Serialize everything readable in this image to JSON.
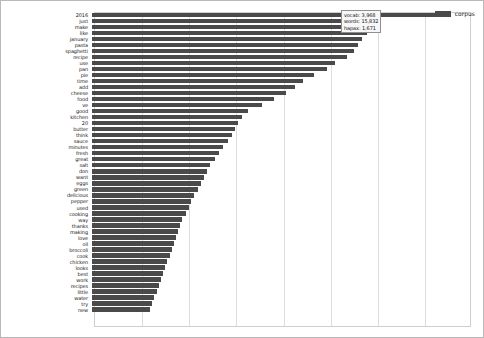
{
  "legend": {
    "items": [
      {
        "label": "corpus",
        "color": "#4a4a4a",
        "swatch_icon": "legend-swatch-icon"
      }
    ],
    "position": "top-right"
  },
  "tooltip": {
    "lines": [
      "vocab: 3,968",
      "words: 15,832",
      "hapax: 1,671"
    ],
    "vocab_label": "vocab: 3,968",
    "words_label": "words: 15,832",
    "hapax_label": "hapax: 1,671"
  },
  "axes": {
    "x_tick_labels": [],
    "y_tick_labels": [],
    "gridline_count": 7,
    "grid": true
  },
  "chart_data": {
    "type": "bar",
    "orientation": "horizontal",
    "title": "",
    "xlabel": "",
    "ylabel": "",
    "grid": true,
    "legend_position": "top-right",
    "series": [
      {
        "name": "corpus",
        "color": "#4a4a4a",
        "values": [
          327,
          262,
          259,
          255,
          251,
          247,
          243,
          237,
          226,
          218,
          206,
          196,
          188,
          180,
          169,
          158,
          145,
          139,
          136,
          133,
          130,
          126,
          122,
          118,
          114,
          110,
          107,
          104,
          101,
          98,
          95,
          92,
          90,
          87,
          84,
          82,
          80,
          78,
          76,
          74,
          72,
          70,
          68,
          66,
          64,
          62,
          60,
          58,
          56,
          54
        ]
      }
    ],
    "categories": [
      "2016",
      "just",
      "make",
      "like",
      "january",
      "pasta",
      "spaghetti",
      "recipe",
      "use",
      "pan",
      "pie",
      "time",
      "add",
      "cheese",
      "food",
      "ve",
      "good",
      "kitchen",
      "20",
      "butter",
      "think",
      "sauce",
      "minutes",
      "fresh",
      "great",
      "salt",
      "don",
      "want",
      "eggs",
      "green",
      "delicious",
      "pepper",
      "used",
      "cooking",
      "way",
      "thanks",
      "making",
      "love",
      "oil",
      "broccoli",
      "cook",
      "chicken",
      "looks",
      "best",
      "work",
      "recipes",
      "little",
      "water",
      "try",
      "new"
    ],
    "xlim": [
      0,
      350
    ],
    "value_max": 350
  }
}
